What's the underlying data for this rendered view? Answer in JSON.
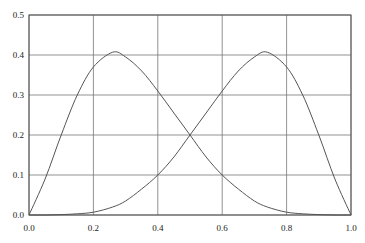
{
  "chart_data": {
    "type": "line",
    "title": "",
    "xlabel": "",
    "ylabel": "",
    "xlim": [
      0.0,
      1.0
    ],
    "ylim": [
      0.0,
      0.5
    ],
    "grid": true,
    "legend": null,
    "x_ticks": [
      "0.0",
      "0.2",
      "0.4",
      "0.6",
      "0.8",
      "1.0"
    ],
    "y_ticks": [
      "0.0",
      "0.1",
      "0.2",
      "0.3",
      "0.4",
      "0.5"
    ],
    "x": [
      0.0,
      0.05,
      0.1,
      0.15,
      0.2,
      0.26,
      0.3,
      0.35,
      0.4,
      0.45,
      0.5,
      0.55,
      0.6,
      0.65,
      0.7,
      0.74,
      0.8,
      0.85,
      0.9,
      0.95,
      1.0
    ],
    "series": [
      {
        "name": "left-curve",
        "values": [
          0.0,
          0.09,
          0.2,
          0.3,
          0.37,
          0.407,
          0.395,
          0.36,
          0.31,
          0.255,
          0.2,
          0.145,
          0.1,
          0.065,
          0.035,
          0.02,
          0.007,
          0.003,
          0.001,
          0.0,
          0.0
        ]
      },
      {
        "name": "right-curve",
        "values": [
          0.0,
          0.0,
          0.001,
          0.003,
          0.007,
          0.02,
          0.035,
          0.065,
          0.1,
          0.145,
          0.2,
          0.255,
          0.31,
          0.36,
          0.395,
          0.407,
          0.37,
          0.3,
          0.2,
          0.09,
          0.0
        ]
      }
    ]
  }
}
